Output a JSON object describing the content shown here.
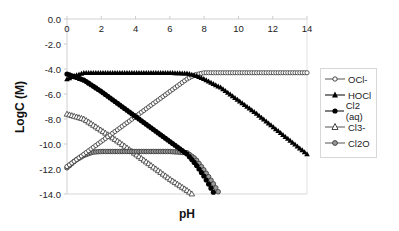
{
  "chart_data": {
    "type": "line",
    "title": "",
    "xlabel": "pH",
    "ylabel": "LogC (M)",
    "xlim": [
      0,
      14
    ],
    "ylim": [
      -14,
      0
    ],
    "x_ticks": [
      "0",
      "2",
      "4",
      "6",
      "8",
      "10",
      "12",
      "14"
    ],
    "y_ticks": [
      "0.0",
      "-2.0",
      "-4.0",
      "-6.0",
      "-8.0",
      "-10.0",
      "-12.0",
      "-14.0"
    ],
    "x_axis_position": "top",
    "grid": false,
    "legend_position": "right",
    "series": [
      {
        "name": "OCl-",
        "marker": "open-circle",
        "x": [
          0,
          1,
          2,
          3,
          4,
          5,
          6,
          7,
          7.5,
          8,
          9,
          10,
          11,
          12,
          13,
          14
        ],
        "y": [
          -11.8,
          -10.8,
          -9.8,
          -8.8,
          -7.8,
          -6.8,
          -5.8,
          -4.8,
          -4.45,
          -4.3,
          -4.3,
          -4.3,
          -4.3,
          -4.3,
          -4.3,
          -4.3
        ]
      },
      {
        "name": "HOCl",
        "marker": "filled-triangle",
        "x": [
          0,
          0.5,
          1,
          2,
          3,
          4,
          5,
          6,
          7,
          7.5,
          8,
          9,
          10,
          11,
          12,
          13,
          14
        ],
        "y": [
          -4.8,
          -4.5,
          -4.3,
          -4.3,
          -4.3,
          -4.3,
          -4.3,
          -4.3,
          -4.35,
          -4.5,
          -4.8,
          -5.5,
          -6.5,
          -7.5,
          -8.6,
          -9.7,
          -10.8
        ]
      },
      {
        "name": "Cl2 (aq)",
        "marker": "filled-circle",
        "x": [
          0,
          1,
          2,
          3,
          4,
          5,
          6,
          7,
          7.5,
          8,
          8.6
        ],
        "y": [
          -4.4,
          -4.9,
          -5.8,
          -6.8,
          -7.8,
          -8.8,
          -9.8,
          -10.8,
          -11.6,
          -12.6,
          -14.0
        ]
      },
      {
        "name": "Cl3-",
        "marker": "open-triangle",
        "x": [
          0,
          1,
          2,
          3,
          4,
          5,
          6,
          7,
          7.3
        ],
        "y": [
          -7.6,
          -8.0,
          -8.9,
          -9.8,
          -10.8,
          -11.8,
          -12.8,
          -13.7,
          -14.0
        ]
      },
      {
        "name": "Cl2O",
        "marker": "gray-circle",
        "x": [
          0,
          0.5,
          1,
          1.5,
          2,
          3,
          4,
          5,
          6,
          7,
          7.5,
          8,
          8.5,
          8.9
        ],
        "y": [
          -11.9,
          -11.3,
          -10.9,
          -10.65,
          -10.6,
          -10.6,
          -10.6,
          -10.6,
          -10.6,
          -10.7,
          -11.2,
          -12.1,
          -13.1,
          -14.0
        ]
      }
    ]
  },
  "legend": {
    "items": [
      {
        "label": "OCl-"
      },
      {
        "label": "HOCl"
      },
      {
        "label": "Cl2 (aq)"
      },
      {
        "label": "Cl3-"
      },
      {
        "label": "Cl2O"
      }
    ]
  },
  "axes": {
    "xlabel": "pH",
    "ylabel": "LogC (M)"
  }
}
